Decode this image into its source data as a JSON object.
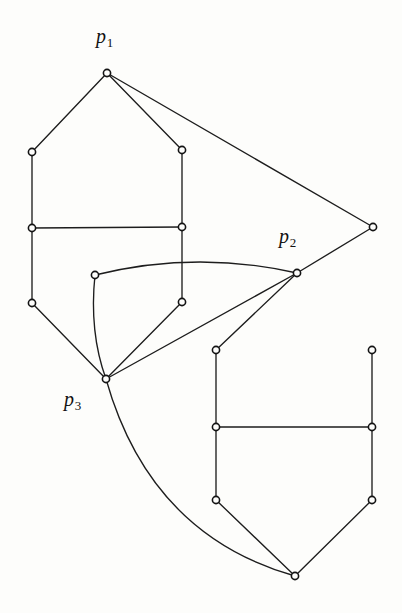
{
  "figure": {
    "background_color": "#fdfdfb",
    "ink_color": "#1d1d1d",
    "width": 402,
    "height": 613
  },
  "labels": [
    {
      "name": "label-p1",
      "base": "p",
      "sub": "1",
      "x": 96,
      "y": 26
    },
    {
      "name": "label-p2",
      "base": "p",
      "sub": "2",
      "x": 279,
      "y": 226
    },
    {
      "name": "label-p3",
      "base": "p",
      "sub": "3",
      "x": 64,
      "y": 389
    }
  ],
  "graph": {
    "vertex_radius": 3.6,
    "vertices": [
      {
        "id": "p1",
        "x": 107,
        "y": 73,
        "label": "p1"
      },
      {
        "id": "lA",
        "x": 32,
        "y": 152,
        "label": ""
      },
      {
        "id": "lB",
        "x": 182,
        "y": 150,
        "label": ""
      },
      {
        "id": "lC",
        "x": 32,
        "y": 228,
        "label": ""
      },
      {
        "id": "lD",
        "x": 182,
        "y": 227,
        "label": ""
      },
      {
        "id": "lE",
        "x": 32,
        "y": 303,
        "label": ""
      },
      {
        "id": "lF",
        "x": 182,
        "y": 302,
        "label": ""
      },
      {
        "id": "m1",
        "x": 95,
        "y": 275,
        "label": ""
      },
      {
        "id": "p3",
        "x": 106,
        "y": 379,
        "label": "p3"
      },
      {
        "id": "p2",
        "x": 297,
        "y": 273,
        "label": "p2"
      },
      {
        "id": "far",
        "x": 373,
        "y": 227,
        "label": ""
      },
      {
        "id": "rA",
        "x": 216,
        "y": 350,
        "label": ""
      },
      {
        "id": "rB",
        "x": 372,
        "y": 350,
        "label": ""
      },
      {
        "id": "rC",
        "x": 216,
        "y": 427,
        "label": ""
      },
      {
        "id": "rD",
        "x": 372,
        "y": 427,
        "label": ""
      },
      {
        "id": "rE",
        "x": 216,
        "y": 500,
        "label": ""
      },
      {
        "id": "rF",
        "x": 372,
        "y": 500,
        "label": ""
      },
      {
        "id": "bot",
        "x": 295,
        "y": 576,
        "label": ""
      }
    ],
    "edges": [
      {
        "name": "edge-p1-lA",
        "from": "p1",
        "to": "lA",
        "kind": "line"
      },
      {
        "name": "edge-p1-lB",
        "from": "p1",
        "to": "lB",
        "kind": "line"
      },
      {
        "name": "edge-p1-far",
        "from": "p1",
        "to": "far",
        "kind": "line"
      },
      {
        "name": "edge-lA-lC",
        "from": "lA",
        "to": "lC",
        "kind": "line"
      },
      {
        "name": "edge-lB-lD",
        "from": "lB",
        "to": "lD",
        "kind": "line"
      },
      {
        "name": "edge-lC-lD",
        "from": "lC",
        "to": "lD",
        "kind": "line"
      },
      {
        "name": "edge-lC-lE",
        "from": "lC",
        "to": "lE",
        "kind": "line"
      },
      {
        "name": "edge-lD-lF",
        "from": "lD",
        "to": "lF",
        "kind": "line"
      },
      {
        "name": "edge-lE-p3",
        "from": "lE",
        "to": "p3",
        "kind": "line"
      },
      {
        "name": "edge-lF-p3",
        "from": "lF",
        "to": "p3",
        "kind": "line"
      },
      {
        "name": "edge-m1-p2",
        "from": "m1",
        "to": "p2",
        "kind": "curve",
        "cx": 196,
        "cy": 250
      },
      {
        "name": "edge-m1-p3",
        "from": "m1",
        "to": "p3",
        "kind": "curve",
        "cx": 89,
        "cy": 332
      },
      {
        "name": "edge-p3-p2",
        "from": "p3",
        "to": "p2",
        "kind": "line"
      },
      {
        "name": "edge-p2-far",
        "from": "p2",
        "to": "far",
        "kind": "line"
      },
      {
        "name": "edge-p2-rA",
        "from": "p2",
        "to": "rA",
        "kind": "line"
      },
      {
        "name": "edge-p3-bot",
        "from": "p3",
        "to": "bot",
        "kind": "curve",
        "cx": 150,
        "cy": 535
      },
      {
        "name": "edge-rA-rC",
        "from": "rA",
        "to": "rC",
        "kind": "line"
      },
      {
        "name": "edge-rB-rD",
        "from": "rB",
        "to": "rD",
        "kind": "line"
      },
      {
        "name": "edge-rC-rD",
        "from": "rC",
        "to": "rD",
        "kind": "line"
      },
      {
        "name": "edge-rC-rE",
        "from": "rC",
        "to": "rE",
        "kind": "line"
      },
      {
        "name": "edge-rD-rF",
        "from": "rD",
        "to": "rF",
        "kind": "line"
      },
      {
        "name": "edge-rE-bot",
        "from": "rE",
        "to": "bot",
        "kind": "line"
      },
      {
        "name": "edge-rF-bot",
        "from": "rF",
        "to": "bot",
        "kind": "line"
      },
      {
        "name": "edge-rA-rB",
        "from": "rA",
        "to": "rB",
        "kind": "hidden"
      }
    ]
  }
}
